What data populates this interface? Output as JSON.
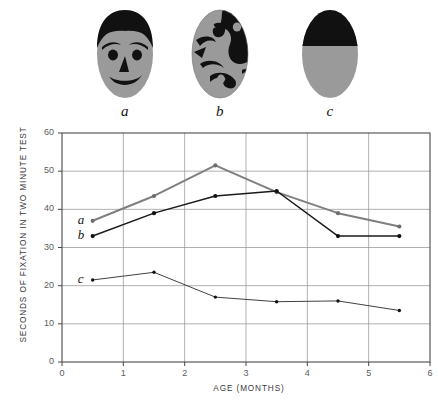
{
  "stimuli": {
    "items": [
      {
        "id": "a",
        "label": "a",
        "icon": "schematic-face-icon",
        "description": "schematic face"
      },
      {
        "id": "b",
        "label": "b",
        "icon": "scrambled-face-icon",
        "description": "scrambled face"
      },
      {
        "id": "c",
        "label": "c",
        "icon": "half-black-oval-icon",
        "description": "control half black oval"
      }
    ]
  },
  "colors": {
    "series_a": "#7f7f7f",
    "series_b": "#1a1a1a",
    "series_c": "#2b2b2b",
    "grid": "#8f8f8f",
    "axis": "#4a4a4a",
    "face_gray": "#9a9a9a",
    "face_black": "#111111",
    "text": "#3a3a3a"
  },
  "chart_data": {
    "type": "line",
    "title": "",
    "xlabel": "AGE  (MONTHS)",
    "ylabel": "SECONDS OF FIXATION IN TWO MINUTE TEST",
    "xlim": [
      0,
      6
    ],
    "ylim": [
      0,
      60
    ],
    "xticks": [
      0,
      1,
      2,
      3,
      4,
      5,
      6
    ],
    "yticks": [
      0,
      10,
      20,
      30,
      40,
      50,
      60
    ],
    "grid": true,
    "legend": "inline-labels",
    "series": [
      {
        "name": "a",
        "label": "a",
        "color": "#7f7f7f",
        "x": [
          0.5,
          1.5,
          2.5,
          3.5,
          4.5,
          5.5
        ],
        "values": [
          37,
          43.5,
          51.5,
          44.5,
          39,
          35.5
        ]
      },
      {
        "name": "b",
        "label": "b",
        "color": "#1a1a1a",
        "x": [
          0.5,
          1.5,
          2.5,
          3.5,
          4.5,
          5.5
        ],
        "values": [
          33,
          39,
          43.5,
          44.8,
          33,
          33
        ]
      },
      {
        "name": "c",
        "label": "c",
        "color": "#2b2b2b",
        "x": [
          0.5,
          1.5,
          2.5,
          3.5,
          4.5,
          5.5
        ],
        "values": [
          21.5,
          23.5,
          17,
          15.8,
          16,
          13.5
        ]
      }
    ]
  }
}
